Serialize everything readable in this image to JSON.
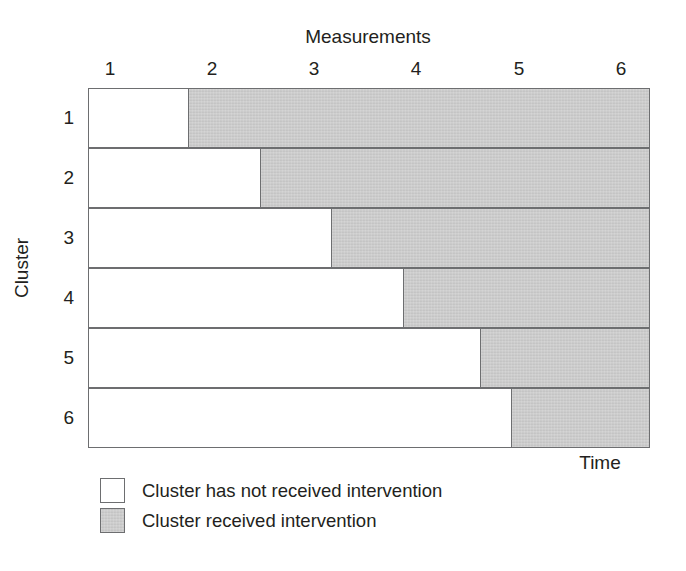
{
  "chart_data": {
    "type": "bar",
    "title": "",
    "xlabel": "Measurements",
    "ylabel": "Cluster",
    "secondary_xlabel": "Time",
    "grid": false,
    "legend_position": "below-left",
    "xlim": [
      0.5,
      6.5
    ],
    "x_ticks": [
      1,
      2,
      3,
      4,
      5,
      6
    ],
    "x_tick_labels": [
      "1",
      "2",
      "3",
      "4",
      "5",
      "6"
    ],
    "categories": [
      "1",
      "2",
      "3",
      "4",
      "5",
      "6"
    ],
    "y_tick_labels": [
      "1",
      "2",
      "3",
      "4",
      "5",
      "6"
    ],
    "series": [
      {
        "name": "Cluster has not received intervention",
        "color": "#ffffff",
        "values": [
          1.5,
          2.2,
          2.9,
          3.6,
          4.4,
          4.7
        ]
      },
      {
        "name": "Cluster received intervention",
        "color": "#c9c9c9",
        "values": [
          4.7,
          4.0,
          3.3,
          2.6,
          1.8,
          1.5
        ]
      }
    ],
    "rows": [
      {
        "cluster": "1",
        "crossover_at": 1.5,
        "control_fraction_pct": 18.0
      },
      {
        "cluster": "2",
        "crossover_at": 2.2,
        "control_fraction_pct": 30.8
      },
      {
        "cluster": "3",
        "crossover_at": 2.9,
        "control_fraction_pct": 43.4
      },
      {
        "cluster": "4",
        "crossover_at": 3.6,
        "control_fraction_pct": 56.2
      },
      {
        "cluster": "5",
        "crossover_at": 4.4,
        "control_fraction_pct": 69.9
      },
      {
        "cluster": "6",
        "crossover_at": 4.7,
        "control_fraction_pct": 75.4
      }
    ],
    "legend": [
      {
        "label": "Cluster has not received intervention",
        "swatch": "control",
        "color": "#ffffff"
      },
      {
        "label": "Cluster received intervention",
        "swatch": "intervention",
        "color": "#c9c9c9"
      }
    ]
  },
  "axes": {
    "x_title": "Measurements",
    "y_title": "Cluster",
    "time_label": "Time"
  },
  "ticks": {
    "x": [
      "1",
      "2",
      "3",
      "4",
      "5",
      "6"
    ],
    "y": [
      "1",
      "2",
      "3",
      "4",
      "5",
      "6"
    ]
  },
  "legend": {
    "items": [
      {
        "label": "Cluster has not received intervention"
      },
      {
        "label": "Cluster received intervention"
      }
    ]
  },
  "colors": {
    "intervention_fill": "#c9c9c9",
    "control_fill": "#ffffff",
    "outline": "#6d6e70",
    "text": "#231f20"
  }
}
